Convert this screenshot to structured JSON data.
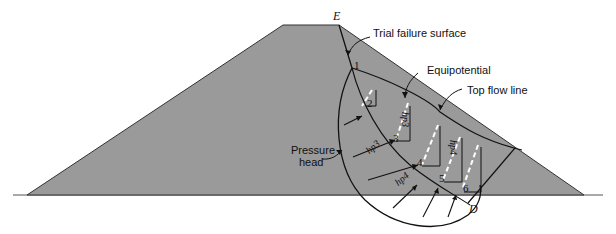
{
  "diagram": {
    "colors": {
      "dam_fill": "#9a9a9a",
      "line": "#111111",
      "equipotential_dash": "#ffffff",
      "background": "#ffffff"
    },
    "labels": {
      "point_E": "E",
      "point_D": "D",
      "trial_failure_surface": "Trial failure surface",
      "equipotential": "Equipotential",
      "top_flow_line": "Top flow line",
      "pressure_head_line1": "Pressure",
      "pressure_head_line2": "head",
      "slice_numbers": [
        "1",
        "2",
        "3",
        "4",
        "5",
        "6"
      ],
      "hp3": "hp3",
      "hp4": "hp4",
      "hp5_left": "hp4",
      "hp_left_upper": "hp3"
    }
  }
}
